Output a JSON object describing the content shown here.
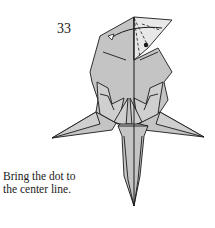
{
  "step": {
    "number": "33"
  },
  "instruction": {
    "line1": "Bring the dot to",
    "line2": "the center line."
  },
  "colors": {
    "paper_fill": "#c4c4c4",
    "paper_fill_light": "#d6d6d6",
    "line": "#1a1a1a",
    "background": "#ffffff"
  },
  "figure": {
    "markers": [
      "dot",
      "fold-arrow",
      "valley-fold-dashed-lines",
      "center-line"
    ]
  }
}
